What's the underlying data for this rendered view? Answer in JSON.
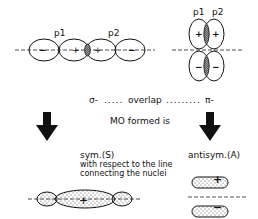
{
  "sigma_diagram": {
    "orbital_labels": [
      "p1",
      "p2"
    ],
    "lobe_signs": [
      "−",
      "+",
      "+",
      "−"
    ]
  },
  "pi_diagram": {
    "orbital_labels": [
      "p1",
      "p2"
    ],
    "lobe_signs": [
      "+",
      "+",
      "−",
      "−"
    ]
  },
  "overlap_line": {
    "left": "σ-",
    "middle": "overlap",
    "right": "π-"
  },
  "mo_formed_label": "MO formed is",
  "results": {
    "sigma": {
      "label": "sym.(S)",
      "note_line1": "with respect to the line",
      "note_line2": "connecting the nuclei"
    },
    "pi": {
      "label": "antisym.(A)"
    }
  },
  "colors": {
    "ink": "#111111",
    "background": "#ffffff",
    "shade": "#777777"
  }
}
